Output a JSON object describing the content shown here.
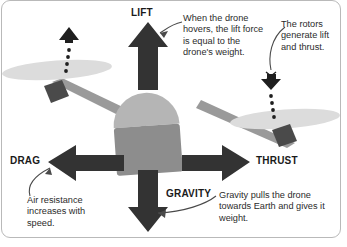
{
  "figure": {
    "type": "labelled-diagram",
    "colors": {
      "arrow": "#333333",
      "body_top": "#b3b3b3",
      "body_bottom": "#8c8c8c",
      "rotor_blade": "#d9d9d9",
      "motor_block": "#4d4d4d",
      "arm": "#999999",
      "frame_border": "#b9b9b9",
      "text": "#2b2b2b",
      "background": "#ffffff"
    }
  },
  "force_labels": {
    "lift": "LIFT",
    "drag": "DRAG",
    "thrust": "THRUST",
    "gravity": "GRAVITY"
  },
  "callouts": {
    "lift": "When the drone hovers, the lift force is equal to the drone's weight.",
    "rotors": "The rotors generate lift and thrust.",
    "drag": "Air resistance increases with speed.",
    "gravity": "Gravity pulls the drone towards Earth and gives it weight."
  },
  "icons": {
    "lift_arrow": "arrow-up-icon",
    "drag_arrow": "arrow-left-icon",
    "thrust_arrow": "arrow-right-icon",
    "gravity_arrow": "arrow-down-icon",
    "left_spin": "rotor-direction-up-icon",
    "right_spin": "rotor-direction-down-icon"
  }
}
